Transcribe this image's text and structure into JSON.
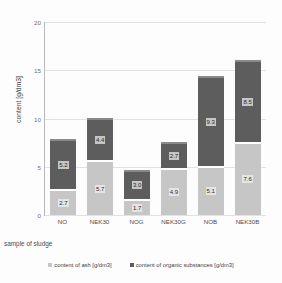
{
  "chart_data": {
    "type": "bar",
    "stacked": true,
    "title": "",
    "xlabel": "sample of sludge",
    "ylabel": "content [g/dm3]",
    "categories": [
      "NO",
      "NEK30",
      "NOG",
      "NEK30G",
      "NOB",
      "NEK30B"
    ],
    "series": [
      {
        "name": "content of ash [g/dm3]",
        "color": "#c6c6c6",
        "values": [
          2.7,
          5.7,
          1.7,
          4.9,
          5.1,
          7.6
        ]
      },
      {
        "name": "content of organic substances [g/dm3]",
        "color": "#5d5d5d",
        "values": [
          5.2,
          4.4,
          3.0,
          2.7,
          9.3,
          8.5
        ]
      }
    ],
    "totals": [
      7.9,
      10.1,
      4.7,
      7.6,
      14.4,
      16.1
    ],
    "ylim": [
      0,
      20
    ],
    "yticks": [
      0,
      5,
      10,
      15,
      20
    ],
    "ytick_labels": [
      "0",
      "5",
      "10",
      "15",
      "20"
    ],
    "grid": true,
    "legend_position": "bottom"
  },
  "axes": {
    "y_title": "content [g/dm3]",
    "x_title": "sample of sludge"
  },
  "legend": {
    "items": [
      {
        "label": "content of ash [g/dm3]",
        "color": "#c6c6c6"
      },
      {
        "label": "content of organic substances [g/dm3]",
        "color": "#5d5d5d"
      }
    ]
  }
}
